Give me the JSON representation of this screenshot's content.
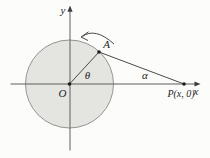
{
  "figure": {
    "labels": {
      "y_axis": "y",
      "x_axis": "x",
      "origin": "O",
      "point_a": "A",
      "angle_theta": "θ",
      "angle_alpha": "α",
      "point_p": "P(x, 0)"
    },
    "colors": {
      "background": "#fcfcfa",
      "circle_fill": "#e4e4e1",
      "circle_stroke": "#949494",
      "axis_stroke": "#5f5f5f",
      "segment_stroke": "#4a4a4a",
      "dot_fill": "#1c1c1c",
      "label_color": "#1f1f1f"
    }
  }
}
